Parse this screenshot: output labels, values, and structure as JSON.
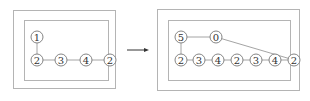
{
  "diagram": {
    "before": {
      "nodes": [
        {
          "id": "b1",
          "label": "1",
          "x": 37,
          "y": 37
        },
        {
          "id": "b2",
          "label": "2",
          "x": 37,
          "y": 60
        },
        {
          "id": "b3",
          "label": "3",
          "x": 61,
          "y": 60
        },
        {
          "id": "b4",
          "label": "4",
          "x": 86,
          "y": 60
        },
        {
          "id": "b5",
          "label": "2",
          "x": 110,
          "y": 60
        }
      ],
      "edges": [
        [
          "b1",
          "b2"
        ],
        [
          "b2",
          "b3"
        ],
        [
          "b3",
          "b4"
        ],
        [
          "b4",
          "b5"
        ]
      ]
    },
    "after": {
      "nodes": [
        {
          "id": "a1",
          "label": "5",
          "x": 181,
          "y": 37
        },
        {
          "id": "a2",
          "label": "0",
          "x": 216,
          "y": 37
        },
        {
          "id": "a3",
          "label": "2",
          "x": 181,
          "y": 60
        },
        {
          "id": "a4",
          "label": "3",
          "x": 199,
          "y": 60
        },
        {
          "id": "a5",
          "label": "4",
          "x": 218,
          "y": 60
        },
        {
          "id": "a6",
          "label": "2",
          "x": 237,
          "y": 60
        },
        {
          "id": "a7",
          "label": "3",
          "x": 256,
          "y": 60
        },
        {
          "id": "a8",
          "label": "4",
          "x": 275,
          "y": 60
        },
        {
          "id": "a9",
          "label": "2",
          "x": 294,
          "y": 60
        }
      ],
      "edges": [
        [
          "a1",
          "a2"
        ],
        [
          "a1",
          "a3"
        ],
        [
          "a3",
          "a4"
        ],
        [
          "a4",
          "a5"
        ],
        [
          "a5",
          "a6"
        ],
        [
          "a6",
          "a7"
        ],
        [
          "a7",
          "a8"
        ],
        [
          "a8",
          "a9"
        ],
        [
          "a2",
          "a9"
        ]
      ]
    },
    "arrow": {
      "from": "before",
      "to": "after"
    }
  }
}
